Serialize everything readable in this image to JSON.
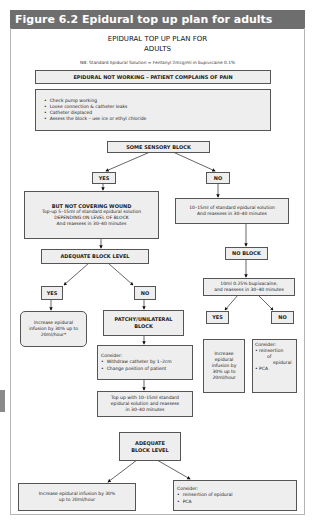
{
  "figure": {
    "caption": "Figure 6.2  Epidural top up plan for adults"
  },
  "chart": {
    "title_line1": "EPIDURAL TOP UP PLAN FOR",
    "title_line2": "ADULTS",
    "note": "NB: Standard Epidural Solution = Fentanyl 2mcg/ml in bupivicaine 0.1%",
    "start": "EPIDURAL NOT WORKING – PATIENT COMPLAINS OF PAIN",
    "checks": [
      "Check pump working",
      "Loose connection & catheter leaks",
      "Catheter displaced",
      "Assess the block – use ice or ethyl chloride"
    ],
    "decision1": "SOME SENSORY BLOCK",
    "yes": "YES",
    "no": "NO",
    "yes_branch": {
      "heading": "BUT NOT COVERING WOUND",
      "line1": "Top-up 5–15ml of standard epidural solution",
      "line2": "DEPENDING ON LEVEL OF BLOCK",
      "line3": "And reassess in 30–40 minutes"
    },
    "no_branch": {
      "line1": "10–15ml of standard epidural solution",
      "line2": "And reassess in 30–40 minutes"
    },
    "adequate_block": "ADEQUATE BLOCK LEVEL",
    "no_block": "NO BLOCK",
    "bupivacaine": {
      "line1": "10ml 0.25% bupivacaine,",
      "line2": "and reassess in 30–40 minutes"
    },
    "increase_left": {
      "line1": "Increase epidural",
      "line2": "infusion by 30% up to",
      "line3": "20ml/hour*"
    },
    "patchy": {
      "line1": "PATCHY/UNILATERAL",
      "line2": "BLOCK"
    },
    "consider_mid": {
      "heading": "Consider:",
      "items": [
        "Withdraw catheter by 1–2cm",
        "Change position of patient"
      ]
    },
    "increase_right": {
      "line1": "Increase",
      "line2": "epidural",
      "line3": "infusion by",
      "line4": "30% up to",
      "line5": "20ml/hour"
    },
    "consider_right": {
      "heading": "Consider:",
      "item1_a": "reinsertion",
      "item1_b": "of",
      "item1_c": "epidural",
      "item2": "PCA"
    },
    "topup": {
      "line1": "Top up with 10–15ml standard",
      "line2": "epidural solution and reassess",
      "line3": "in 30–40 minutes"
    },
    "adequate2": {
      "line1": "ADEQUATE",
      "line2": "BLOCK LEVEL"
    },
    "increase_bottom": {
      "line1": "Increase epidural infusion by 30%",
      "line2": "up to 20ml/hour"
    },
    "consider_bottom": {
      "heading": "Consider:",
      "items": [
        "reinsertion of epidural",
        "PCA"
      ]
    }
  }
}
